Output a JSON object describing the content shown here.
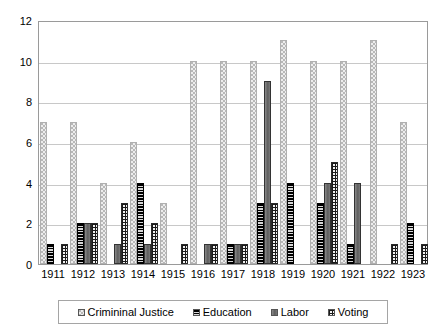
{
  "chart": {
    "type": "bar",
    "title": "",
    "xlabel": "",
    "ylabel": "",
    "legend_position": "bottom"
  },
  "axis": {
    "y_ticks": [
      "0",
      "2",
      "4",
      "6",
      "8",
      "10",
      "12"
    ],
    "x_ticks": [
      "1911",
      "1912",
      "1913",
      "1914",
      "1915",
      "1916",
      "1917",
      "1918",
      "1919",
      "1920",
      "1921",
      "1922",
      "1923"
    ]
  },
  "legend": {
    "items": [
      {
        "label": "Crimininal Justice",
        "key": "criminal_justice",
        "pattern": "light-dotted",
        "color": "#ededed"
      },
      {
        "label": "Education",
        "key": "education",
        "pattern": "dark-horizontal-stripes",
        "color": "#1c1c1c"
      },
      {
        "label": "Labor",
        "key": "labor",
        "pattern": "solid-gray",
        "color": "#6e6e6e"
      },
      {
        "label": "Voting",
        "key": "voting",
        "pattern": "checkered-grid",
        "color": "#f2f2f2"
      }
    ]
  },
  "chart_data": {
    "type": "bar",
    "title": "",
    "xlabel": "",
    "ylabel": "",
    "ylim": [
      0,
      12
    ],
    "y_ticks": [
      0,
      2,
      4,
      6,
      8,
      10,
      12
    ],
    "grid": true,
    "legend_position": "bottom",
    "categories": [
      "1911",
      "1912",
      "1913",
      "1914",
      "1915",
      "1916",
      "1917",
      "1918",
      "1919",
      "1920",
      "1921",
      "1922",
      "1923"
    ],
    "series": [
      {
        "name": "Crimininal Justice",
        "values": [
          7,
          7,
          4,
          6,
          3,
          10,
          10,
          10,
          11,
          10,
          10,
          11,
          7
        ]
      },
      {
        "name": "Education",
        "values": [
          1,
          2,
          0,
          4,
          0,
          0,
          1,
          3,
          4,
          3,
          1,
          0,
          2
        ]
      },
      {
        "name": "Labor",
        "values": [
          0,
          2,
          1,
          1,
          0,
          1,
          1,
          9,
          0,
          4,
          4,
          0,
          0
        ]
      },
      {
        "name": "Voting",
        "values": [
          1,
          2,
          3,
          2,
          1,
          1,
          1,
          3,
          0,
          5,
          0,
          1,
          1
        ]
      }
    ]
  }
}
